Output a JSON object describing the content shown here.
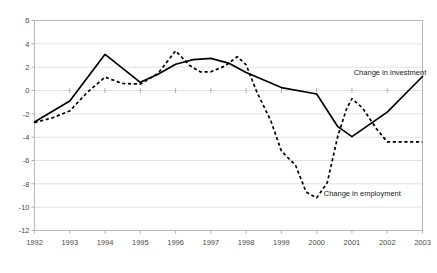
{
  "chart_data": {
    "type": "line",
    "title": "",
    "subtitle": "",
    "xlabel": "",
    "ylabel": "",
    "xlim": [
      1992,
      2003
    ],
    "ylim": [
      -12,
      6
    ],
    "ytick_step": 2,
    "grid": "horizontal-only",
    "legend_position": "inline-annotation",
    "categories": [
      "1992",
      "1993",
      "1994",
      "1995",
      "1996",
      "1997",
      "1998",
      "1999",
      "2000",
      "2001",
      "2002",
      "2003"
    ],
    "xticks": [
      1992,
      1993,
      1994,
      1995,
      1996,
      1997,
      1998,
      1999,
      2000,
      2001,
      2002,
      2003
    ],
    "yticks": [
      6,
      4,
      2,
      0,
      -2,
      -4,
      -6,
      -8,
      -10,
      -12
    ],
    "ytick_labels": [
      "6",
      "4",
      "2",
      "0",
      "-2",
      "-4",
      "-6",
      "-8",
      "-10",
      "-12"
    ],
    "series": [
      {
        "name": "Change in investment",
        "style": "solid",
        "label_x": 2001.05,
        "label_y": 1.35,
        "x": [
          1992,
          1993,
          1994,
          1995,
          1995.5,
          1996,
          1996.5,
          1997,
          1997.5,
          1998,
          1999,
          2000,
          2000.6,
          2001,
          2002,
          2003
        ],
        "values": [
          -2.7,
          -0.9,
          3.1,
          0.7,
          1.4,
          2.25,
          2.65,
          2.75,
          2.35,
          1.55,
          0.25,
          -0.3,
          -3.1,
          -3.95,
          -1.85,
          1.2
        ]
      },
      {
        "name": "Change in employment",
        "style": "dashed",
        "label_x": 2000.2,
        "label_y": -9.05,
        "x": [
          1992,
          1992.5,
          1993,
          1993.5,
          1994,
          1994.5,
          1995,
          1995.5,
          1996,
          1996.4,
          1996.7,
          1997,
          1997.4,
          1997.75,
          1998,
          1998.3,
          1998.7,
          1999,
          1999.4,
          1999.7,
          2000,
          2000.3,
          2000.6,
          2000.85,
          2001,
          2001.3,
          2001.7,
          2002,
          2002.5,
          2003
        ],
        "values": [
          -2.75,
          -2.35,
          -1.75,
          -0.15,
          1.15,
          0.6,
          0.55,
          1.45,
          3.4,
          2.15,
          1.6,
          1.6,
          2.1,
          2.9,
          2.2,
          -0.1,
          -2.6,
          -5.2,
          -6.4,
          -8.7,
          -9.2,
          -7.9,
          -3.9,
          -1.55,
          -0.7,
          -1.5,
          -3.3,
          -4.4,
          -4.4,
          -4.4
        ]
      }
    ]
  }
}
